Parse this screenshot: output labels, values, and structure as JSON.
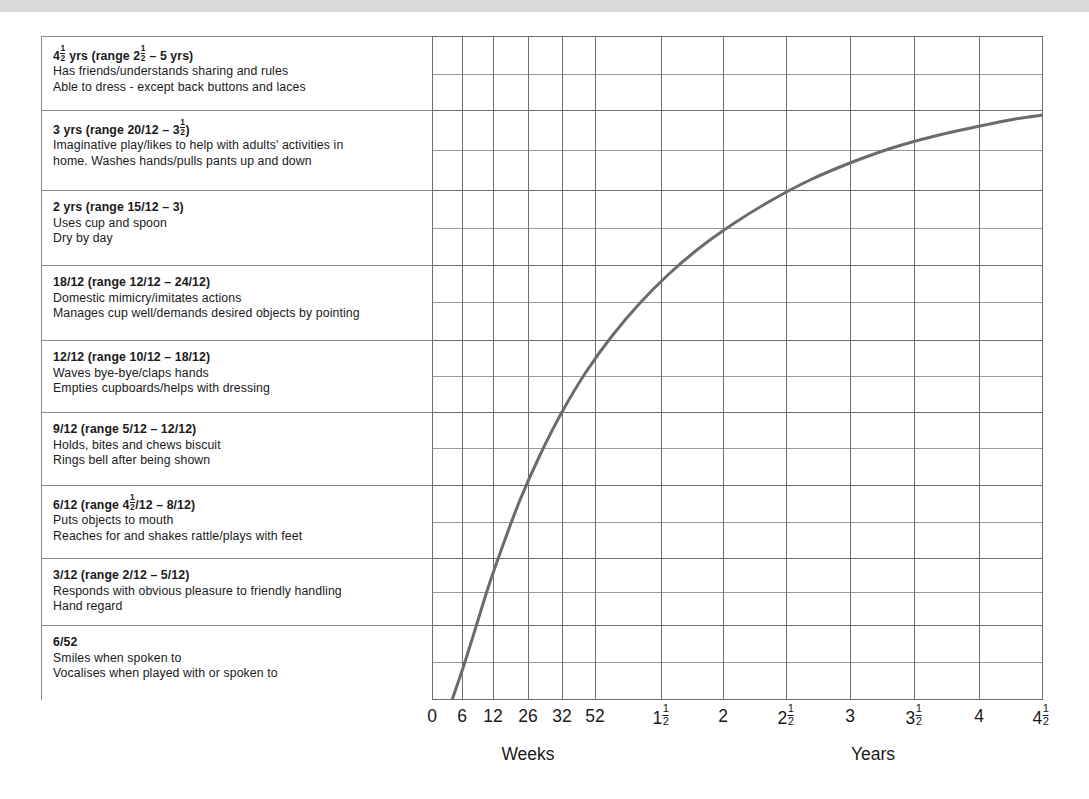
{
  "theme": {
    "top_band_color": "#d9d9d9",
    "page_background": "#ffffff",
    "panel_border_color": "#8a8a8a",
    "grid_major_color": "#6e6e6e",
    "grid_minor_color": "#9a9a9a",
    "curve_color": "#6b6b6b",
    "text_color": "#1a1a1a"
  },
  "milestones": [
    {
      "id": "4-5-yrs",
      "head_pre": "4",
      "head_frac": {
        "num": "1",
        "den": "2"
      },
      "head_post": " yrs (range 2",
      "head_frac2": {
        "num": "1",
        "den": "2"
      },
      "head_post2": " – 5 yrs)",
      "head_plain": "4½ yrs (range 2½ – 5 yrs)",
      "line2": "Has friends/understands sharing and rules",
      "line3": "Able to dress - except back buttons and laces"
    },
    {
      "id": "3-yrs",
      "head_pre": "3 yrs (range 20/12 – 3",
      "head_frac": {
        "num": "1",
        "den": "2"
      },
      "head_post": ")",
      "head_plain": "3 yrs (range 20/12 – 3½)",
      "line2": "Imaginative play/likes to help with adults' activities in",
      "line3": "home. Washes hands/pulls pants up and down"
    },
    {
      "id": "2-yrs",
      "head_plain": "2 yrs (range 15/12 – 3)",
      "line2": "Uses cup and spoon",
      "line3": "Dry by day"
    },
    {
      "id": "18-12",
      "head_plain": "18/12 (range 12/12 – 24/12)",
      "line2": "Domestic mimicry/imitates actions",
      "line3": "Manages cup well/demands desired objects by pointing"
    },
    {
      "id": "12-12",
      "head_plain": "12/12 (range 10/12 – 18/12)",
      "line2": "Waves bye-bye/claps hands",
      "line3": "Empties cupboards/helps with dressing"
    },
    {
      "id": "9-12",
      "head_plain": "9/12 (range 5/12 – 12/12)",
      "line2": "Holds, bites and chews biscuit",
      "line3": "Rings bell after being shown"
    },
    {
      "id": "6-12",
      "head_pre": "6/12 (range 4",
      "head_frac": {
        "num": "1",
        "den": "2"
      },
      "head_post": "/12 – 8/12)",
      "head_plain": "6/12 (range 4½/12 – 8/12)",
      "line2": "Puts objects to mouth",
      "line3": "Reaches for and shakes rattle/plays with feet"
    },
    {
      "id": "3-12",
      "head_plain": "3/12 (range 2/12 – 5/12)",
      "line2": "Responds with obvious pleasure to friendly handling",
      "line3": "Hand regard"
    },
    {
      "id": "6-52",
      "head_plain": "6/52",
      "line2": "Smiles when spoken to",
      "line3": "Vocalises when played with or spoken to"
    }
  ],
  "axis": {
    "weeks_caption": "Weeks",
    "years_caption": "Years",
    "ticks": [
      {
        "label": "0",
        "x": 432
      },
      {
        "label": "6",
        "x": 462
      },
      {
        "label": "12",
        "x": 493
      },
      {
        "label": "26",
        "x": 528
      },
      {
        "label": "32",
        "x": 562
      },
      {
        "label": "52",
        "x": 595
      },
      {
        "label": "1",
        "frac": {
          "num": "1",
          "den": "2"
        },
        "x": 661
      },
      {
        "label": "2",
        "x": 723
      },
      {
        "label": "2",
        "frac": {
          "num": "1",
          "den": "2"
        },
        "x": 786
      },
      {
        "label": "3",
        "x": 850
      },
      {
        "label": "3",
        "frac": {
          "num": "1",
          "den": "2"
        },
        "x": 914
      },
      {
        "label": "4",
        "x": 979
      },
      {
        "label": "4",
        "frac": {
          "num": "1",
          "den": "2"
        },
        "x": 1041
      }
    ],
    "weeks_caption_x": 528,
    "years_caption_x": 873
  },
  "chart_data": {
    "type": "line",
    "title": "",
    "xlabel": "Weeks / Years",
    "ylabel": "Developmental milestone stage",
    "xtick_labels": [
      "0",
      "6",
      "12",
      "26",
      "32",
      "52",
      "1½",
      "2",
      "2½",
      "3",
      "3½",
      "4",
      "4½"
    ],
    "xtick_units": [
      "weeks",
      "weeks",
      "weeks",
      "weeks",
      "weeks",
      "weeks",
      "years",
      "years",
      "years",
      "years",
      "years",
      "years",
      "years"
    ],
    "ytick_labels": [
      "6/52",
      "3/12",
      "6/12",
      "9/12",
      "12/12",
      "18/12",
      "2 yrs",
      "3 yrs",
      "4½ yrs"
    ],
    "grid": true,
    "legend": "none",
    "series": [
      {
        "name": "Developmental progress",
        "comment": "x in pixel space of plot (432=0 weeks, 1043=4.5 yrs); y in pixel space (700=bottom, 36=top)",
        "points": [
          [
            452,
            700
          ],
          [
            463,
            668
          ],
          [
            475,
            630
          ],
          [
            488,
            588
          ],
          [
            503,
            545
          ],
          [
            520,
            500
          ],
          [
            540,
            455
          ],
          [
            562,
            412
          ],
          [
            586,
            372
          ],
          [
            612,
            336
          ],
          [
            640,
            303
          ],
          [
            670,
            273
          ],
          [
            702,
            246
          ],
          [
            736,
            222
          ],
          [
            772,
            200
          ],
          [
            810,
            180
          ],
          [
            850,
            163
          ],
          [
            892,
            148
          ],
          [
            935,
            136
          ],
          [
            980,
            126
          ],
          [
            1015,
            119
          ],
          [
            1043,
            115
          ]
        ]
      }
    ]
  },
  "grid_geometry": {
    "left": 432,
    "top": 36,
    "right": 1043,
    "bottom": 700,
    "vertical_lines": [
      432,
      462,
      493,
      528,
      562,
      595,
      661,
      723,
      786,
      850,
      914,
      979,
      1043
    ],
    "major_horizontal_lines": [
      36,
      110,
      190,
      265,
      340,
      412,
      485,
      558,
      625,
      700
    ],
    "minor_horizontal_lines": [
      74,
      150,
      228,
      302,
      376,
      448,
      522,
      592,
      662
    ]
  }
}
